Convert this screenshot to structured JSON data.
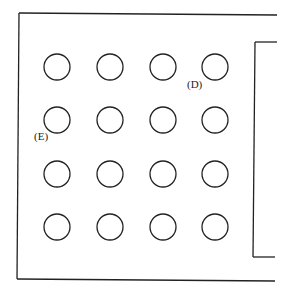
{
  "diagram": {
    "labels": {
      "d": "(D)",
      "e": "(E)"
    },
    "grid": {
      "rows": 4,
      "cols": 4,
      "col_x": [
        57,
        110,
        163,
        215
      ],
      "row_y": [
        67,
        120,
        174,
        227
      ],
      "radius": 13
    },
    "stroke_color": "#222222"
  }
}
